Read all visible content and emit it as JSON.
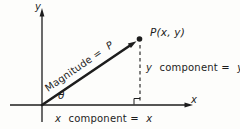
{
  "diagram": {
    "colors": {
      "ink": "#1d1d1d",
      "background": "#fdfdfb"
    },
    "axes": {
      "y_label": "y",
      "x_label": "x"
    },
    "point": {
      "label": "P(x, y)"
    },
    "vector": {
      "text": "Magnitude =",
      "value": "P"
    },
    "angle": {
      "symbol": "θ"
    },
    "components": {
      "y": {
        "var": "y",
        "text": "component =",
        "value": "y"
      },
      "x": {
        "var": "x",
        "text": "component =",
        "value": "x"
      }
    }
  }
}
